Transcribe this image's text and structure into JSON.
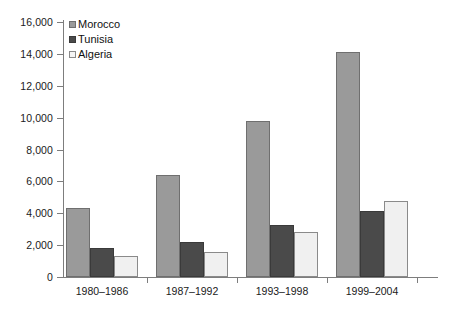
{
  "chart_data": {
    "type": "bar",
    "title": "",
    "subtitle": "",
    "xlabel": "",
    "ylabel": "",
    "grid": false,
    "legend_position": "top-left-inside",
    "categories": [
      "1980–1986",
      "1987–1992",
      "1993–1998",
      "1999–2004"
    ],
    "ylim": [
      0,
      16000
    ],
    "ytick_values": [
      0,
      2000,
      4000,
      6000,
      8000,
      10000,
      12000,
      14000,
      16000
    ],
    "ytick_labels": [
      "0",
      "2,000",
      "4,000",
      "6,000",
      "8,000",
      "10,000",
      "12,000",
      "14,000",
      "16,000"
    ],
    "series": [
      {
        "name": "Morocco",
        "color": "#9a9a9a",
        "values": [
          4350,
          6400,
          9800,
          14100
        ]
      },
      {
        "name": "Tunisia",
        "color": "#4a4a4a",
        "values": [
          1820,
          2200,
          3250,
          4150
        ]
      },
      {
        "name": "Algeria",
        "color": "#f0f0f0",
        "values": [
          1320,
          1580,
          2800,
          4780
        ]
      }
    ]
  }
}
